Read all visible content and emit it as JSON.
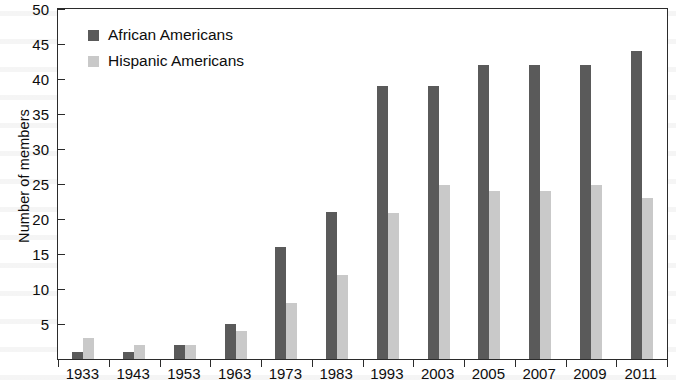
{
  "chart_data": {
    "type": "bar",
    "title": "",
    "xlabel": "",
    "ylabel": "Number of members",
    "ylim": [
      0,
      50
    ],
    "yticks": [
      5,
      10,
      15,
      20,
      25,
      30,
      35,
      40,
      45,
      50
    ],
    "grid": false,
    "legend_position": "top-left",
    "categories": [
      "1933",
      "1943",
      "1953",
      "1963",
      "1973",
      "1983",
      "1993",
      "2003",
      "2005",
      "2007",
      "2009",
      "2011"
    ],
    "series": [
      {
        "name": "African Americans",
        "color": "#5a5a5a",
        "values": [
          1,
          1,
          2,
          5,
          16,
          21,
          39,
          39,
          42,
          42,
          42,
          44
        ]
      },
      {
        "name": "Hispanic Americans",
        "color": "#c9c9c9",
        "values": [
          3,
          2,
          2,
          4,
          8,
          12,
          20.8,
          24.8,
          24,
          24,
          24.8,
          23
        ]
      }
    ]
  },
  "axes": {
    "y_title": "Number of members"
  }
}
